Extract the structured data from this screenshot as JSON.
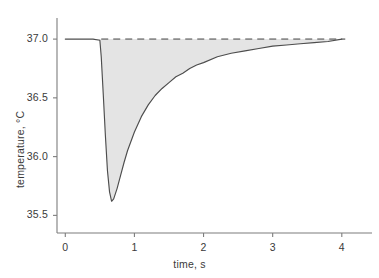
{
  "chart_data": {
    "type": "area",
    "title": "",
    "subtitle": "",
    "xlabel": "time, s",
    "ylabel": "temperature, °C",
    "xlim": [
      -0.12,
      4.35
    ],
    "ylim": [
      35.35,
      37.12
    ],
    "xticks": [
      0,
      1,
      2,
      3,
      4
    ],
    "xticklabels": [
      "0",
      "1",
      "2",
      "3",
      "4"
    ],
    "yticks": [
      35.5,
      36.0,
      36.5,
      37.0
    ],
    "yticklabels": [
      "35.5",
      "36.0",
      "36.5",
      "37.0"
    ],
    "grid": false,
    "legend": null,
    "colors": {
      "curve": "#4d4d4d",
      "fill": "#e4e4e4",
      "baseline_dashed": "#8c8c8c",
      "axis": "#7d7d7d",
      "text": "#3a3a3a",
      "background": "#ffffff"
    },
    "series": [
      {
        "name": "temperature",
        "style": "solid-line-with-fill",
        "x": [
          0.0,
          0.1,
          0.2,
          0.3,
          0.4,
          0.5,
          0.52,
          0.55,
          0.58,
          0.61,
          0.64,
          0.67,
          0.7,
          0.75,
          0.8,
          0.85,
          0.9,
          1.0,
          1.1,
          1.2,
          1.3,
          1.4,
          1.5,
          1.6,
          1.7,
          1.8,
          1.9,
          2.0,
          2.2,
          2.4,
          2.6,
          2.8,
          3.0,
          3.2,
          3.4,
          3.6,
          3.8,
          4.0
        ],
        "y": [
          37.0,
          37.0,
          37.0,
          37.0,
          37.0,
          36.99,
          36.85,
          36.52,
          36.18,
          35.88,
          35.7,
          35.62,
          35.64,
          35.73,
          35.84,
          35.95,
          36.05,
          36.21,
          36.34,
          36.44,
          36.52,
          36.58,
          36.63,
          36.68,
          36.71,
          36.75,
          36.78,
          36.8,
          36.85,
          36.88,
          36.9,
          36.92,
          36.94,
          36.95,
          36.96,
          36.97,
          36.98,
          37.0
        ]
      },
      {
        "name": "baseline 37.0",
        "style": "dashed-line",
        "x": [
          0.52,
          4.05
        ],
        "y": [
          37.0,
          37.0
        ]
      }
    ],
    "annotations": {
      "minimum_temperature": 35.62,
      "minimum_time": 0.67,
      "baseline_temperature": 37.0
    }
  }
}
